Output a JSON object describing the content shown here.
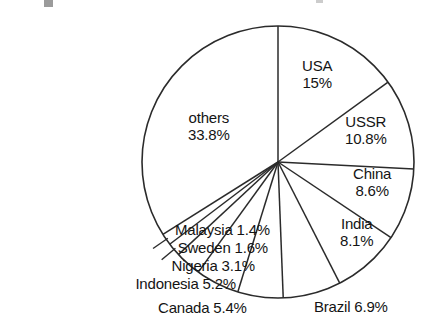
{
  "chart_data": {
    "type": "pie",
    "title": "",
    "subtitle": "",
    "xlabel": "",
    "ylabel": "",
    "legend_position": "none",
    "grid": false,
    "units": "percent",
    "start_angle_deg": 0,
    "direction": "clockwise",
    "categories": [
      "USA",
      "USSR",
      "China",
      "India",
      "Brazil",
      "Canada",
      "Indonesia",
      "Nigeria",
      "Sweden",
      "Malaysia",
      "others"
    ],
    "values": [
      15,
      10.8,
      8.6,
      8.1,
      6.9,
      5.4,
      5.2,
      3.1,
      1.6,
      1.4,
      33.8
    ],
    "slices": [
      {
        "name": "USA",
        "value": 15,
        "value_text": "15%",
        "label_lines": [
          "USA",
          "15%"
        ],
        "label_placement": "inside",
        "label_align": "center",
        "label_left": 302,
        "label_top": 58,
        "start_deg": 0,
        "end_deg": 54
      },
      {
        "name": "USSR",
        "value": 10.8,
        "value_text": "10.8%",
        "label_lines": [
          "USSR",
          "10.8%"
        ],
        "label_placement": "inside",
        "label_align": "center",
        "label_left": 345,
        "label_top": 114,
        "start_deg": 54,
        "end_deg": 92.9
      },
      {
        "name": "China",
        "value": 8.6,
        "value_text": "8.6%",
        "label_lines": [
          "China",
          "8.6%"
        ],
        "label_placement": "inside",
        "label_align": "center",
        "label_left": 353,
        "label_top": 166,
        "start_deg": 92.9,
        "end_deg": 123.8
      },
      {
        "name": "India",
        "value": 8.1,
        "value_text": "8.1%",
        "label_lines": [
          "India",
          "8.1%"
        ],
        "label_placement": "inside",
        "label_align": "center",
        "label_left": 340,
        "label_top": 216,
        "start_deg": 123.8,
        "end_deg": 153
      },
      {
        "name": "Brazil",
        "value": 6.9,
        "value_text": "6.9%",
        "label_lines": [
          "Brazil 6.9%"
        ],
        "label_placement": "outside",
        "label_align": "left",
        "label_left": 314,
        "label_top": 299,
        "start_deg": 153,
        "end_deg": 177.8
      },
      {
        "name": "Canada",
        "value": 5.4,
        "value_text": "5.4%",
        "label_lines": [
          "Canada 5.4%"
        ],
        "label_placement": "outside",
        "label_align": "left",
        "label_left": 158,
        "label_top": 300,
        "start_deg": 177.8,
        "end_deg": 197.2
      },
      {
        "name": "Indonesia",
        "value": 5.2,
        "value_text": "5.2%",
        "label_lines": [
          "Indonesia 5.2%"
        ],
        "label_placement": "outside",
        "label_align": "right",
        "label_right": 236,
        "label_top": 276,
        "start_deg": 197.2,
        "end_deg": 215.9
      },
      {
        "name": "Nigeria",
        "value": 3.1,
        "value_text": "3.1%",
        "label_lines": [
          "Nigeria 3.1%"
        ],
        "label_placement": "outside",
        "label_align": "right",
        "label_right": 255,
        "label_top": 258,
        "start_deg": 215.9,
        "end_deg": 227.1
      },
      {
        "name": "Sweden",
        "value": 1.6,
        "value_text": "1.6%",
        "label_lines": [
          "Sweden 1.6%"
        ],
        "label_placement": "outside",
        "label_align": "right",
        "label_right": 268,
        "label_top": 240,
        "start_deg": 227.1,
        "end_deg": 232.8
      },
      {
        "name": "Malaysia",
        "value": 1.4,
        "value_text": "1.4%",
        "label_lines": [
          "Malaysia 1.4%"
        ],
        "label_placement": "outside",
        "label_align": "right",
        "label_right": 270,
        "label_top": 222,
        "start_deg": 232.8,
        "end_deg": 237.8
      },
      {
        "name": "others",
        "value": 33.8,
        "value_text": "33.8%",
        "label_lines": [
          "others",
          "33.8%"
        ],
        "label_placement": "inside",
        "label_align": "center",
        "label_left": 188,
        "label_top": 110,
        "start_deg": 237.8,
        "end_deg": 360
      }
    ]
  },
  "geometry": {
    "center_x": 278,
    "center_y": 162,
    "radius": 136
  },
  "style": {
    "stroke_color": "#2b2b2b",
    "text_color": "#141414",
    "background": "#ffffff",
    "fill": "none"
  }
}
